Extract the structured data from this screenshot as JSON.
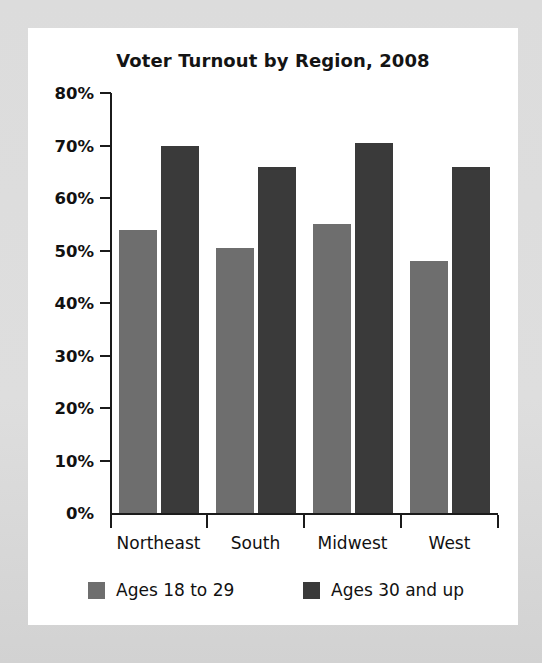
{
  "chart_data": {
    "type": "bar",
    "title": "Voter Turnout by Region, 2008",
    "xlabel": "",
    "ylabel": "",
    "categories": [
      "Northeast",
      "South",
      "Midwest",
      "West"
    ],
    "series": [
      {
        "name": "Ages 18 to 29",
        "color": "#6e6e6e",
        "values": [
          54,
          50.5,
          55,
          48
        ]
      },
      {
        "name": "Ages 30 and up",
        "color": "#3a3a3a",
        "values": [
          70,
          66,
          70.5,
          66
        ]
      }
    ],
    "ylim": [
      0,
      80
    ],
    "ytick_values": [
      0,
      10,
      20,
      30,
      40,
      50,
      60,
      70,
      80
    ],
    "ytick_labels": [
      "0%",
      "10%",
      "20%",
      "30%",
      "40%",
      "50%",
      "60%",
      "70%",
      "80%"
    ],
    "grid": false,
    "legend_position": "bottom",
    "value_suffix": "%"
  },
  "colors": {
    "page_background": "#dcdcdc",
    "card_background": "#ffffff",
    "axis": "#1b1b1b",
    "text": "#111111",
    "series_young": "#6e6e6e",
    "series_old": "#3a3a3a"
  }
}
